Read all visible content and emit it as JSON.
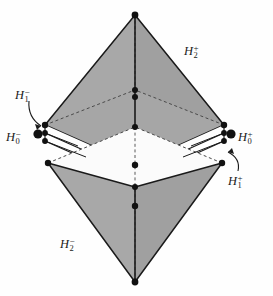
{
  "figure": {
    "name": "bipyramid-halfspace-diagram",
    "background_color": "#fefefe",
    "face_fill": "#a8a8a8",
    "white_fill": "#ffffff",
    "line_color": "#1a1a1a",
    "dot_color": "#111111",
    "width": 273,
    "height": 296
  },
  "labels": {
    "h2_plus": {
      "base": "H",
      "sub": "2",
      "sup": "+"
    },
    "h2_minus": {
      "base": "H",
      "sub": "2",
      "sup": "−"
    },
    "h1_minus": {
      "base": "H",
      "sub": "1",
      "sup": "−"
    },
    "h0_minus": {
      "base": "H",
      "sub": "0",
      "sup": "−"
    },
    "h0_plus": {
      "base": "H",
      "sub": "0",
      "sup": "+"
    },
    "h1_plus": {
      "base": "H",
      "sub": "1",
      "sup": "+"
    }
  },
  "geometry": {
    "top_apex": {
      "x": 135,
      "y": 15
    },
    "bottom_apex": {
      "x": 135,
      "y": 282
    },
    "upper_base": {
      "left": {
        "x": 45,
        "y": 125
      },
      "right": {
        "x": 224,
        "y": 125
      },
      "back": {
        "x": 135,
        "y": 90
      },
      "front": {
        "x": 135,
        "y": 165
      }
    },
    "mid_slab": {
      "left": {
        "x": 45,
        "y": 133
      },
      "right": {
        "x": 224,
        "y": 133
      },
      "back": {
        "x": 135,
        "y": 97
      },
      "front": {
        "x": 135,
        "y": 173
      }
    },
    "lower_base": {
      "left": {
        "x": 48,
        "y": 163
      },
      "right": {
        "x": 222,
        "y": 163
      },
      "back": {
        "x": 135,
        "y": 127
      },
      "front": {
        "x": 135,
        "y": 187
      }
    }
  },
  "vertex_dots": [
    {
      "name": "top-apex-dot",
      "x": 135,
      "y": 15,
      "r": 3.4
    },
    {
      "name": "upper-back-dot-a",
      "x": 135,
      "y": 90,
      "r": 3.0
    },
    {
      "name": "upper-back-dot-b",
      "x": 135,
      "y": 97,
      "r": 3.0
    },
    {
      "name": "upper-left-dot",
      "x": 45,
      "y": 125,
      "r": 3.2
    },
    {
      "name": "upper-right-dot",
      "x": 224,
      "y": 125,
      "r": 3.2
    },
    {
      "name": "mid-left-dot-a",
      "x": 45,
      "y": 133,
      "r": 2.9
    },
    {
      "name": "mid-right-dot-a",
      "x": 224,
      "y": 133,
      "r": 2.9
    },
    {
      "name": "mid-left-dot-b",
      "x": 45,
      "y": 141,
      "r": 2.9
    },
    {
      "name": "mid-right-dot-b",
      "x": 224,
      "y": 141,
      "r": 2.9
    },
    {
      "name": "inner-back-dot",
      "x": 135,
      "y": 127,
      "r": 3.0
    },
    {
      "name": "upper-front-dot",
      "x": 135,
      "y": 165,
      "r": 3.2
    },
    {
      "name": "lower-left-dot",
      "x": 48,
      "y": 163,
      "r": 3.2
    },
    {
      "name": "lower-right-dot",
      "x": 222,
      "y": 163,
      "r": 3.2
    },
    {
      "name": "lower-front-dot",
      "x": 135,
      "y": 187,
      "r": 3.0
    },
    {
      "name": "lower-front-dot-b",
      "x": 135,
      "y": 206,
      "r": 3.2
    },
    {
      "name": "bottom-apex-dot",
      "x": 135,
      "y": 282,
      "r": 3.4
    },
    {
      "name": "h0-minus-marker-dot",
      "x": 38,
      "y": 134,
      "r": 4.6
    },
    {
      "name": "h0-plus-marker-dot",
      "x": 231,
      "y": 134,
      "r": 4.6
    }
  ]
}
